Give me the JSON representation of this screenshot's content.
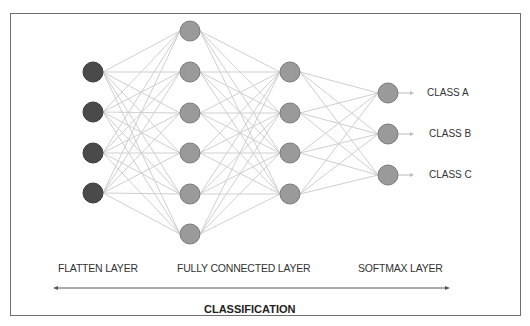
{
  "diagram": {
    "title": "CLASSIFICATION",
    "layers": [
      {
        "name": "FLATTEN LAYER",
        "x": 93,
        "nodes_y": [
          72,
          112,
          153,
          193
        ],
        "color": "#4a4a4a"
      },
      {
        "name": "FULLY CONNECTED LAYER",
        "x": 190,
        "nodes_y": [
          31,
          72,
          113,
          153,
          194,
          234
        ],
        "color": "#9a9a9a"
      },
      {
        "name": "",
        "x": 290,
        "nodes_y": [
          72,
          113,
          153,
          194
        ],
        "color": "#9a9a9a"
      },
      {
        "name": "SOFTMAX LAYER",
        "x": 388,
        "nodes_y": [
          93,
          134,
          175
        ],
        "color": "#9a9a9a"
      }
    ],
    "layer_labels": {
      "flatten": "FLATTEN LAYER",
      "fully_connected": "FULLY CONNECTED LAYER",
      "softmax": "SOFTMAX LAYER"
    },
    "outputs": [
      "CLASS A",
      "CLASS B",
      "CLASS C"
    ],
    "colors": {
      "flatten_node": "#4a4a4a",
      "hidden_node": "#9a9a9a",
      "node_stroke": "#7a7a7a",
      "edge": "#cfcfcf",
      "border": "#6e6e6e"
    }
  }
}
